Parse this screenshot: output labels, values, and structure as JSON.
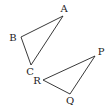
{
  "diagram": {
    "type": "geometry",
    "colors": {
      "stroke": "#222222",
      "background": "#ffffff"
    },
    "triangles": [
      {
        "name": "ABC",
        "vertices": [
          {
            "label": "A",
            "x": 63,
            "y": 16,
            "lx": 64,
            "ly": 9
          },
          {
            "label": "B",
            "x": 21,
            "y": 37,
            "lx": 13,
            "ly": 38
          },
          {
            "label": "C",
            "x": 31,
            "y": 65,
            "lx": 30,
            "ly": 72
          }
        ]
      },
      {
        "name": "PQR",
        "vertices": [
          {
            "label": "P",
            "x": 95,
            "y": 56,
            "lx": 101,
            "ly": 52
          },
          {
            "label": "Q",
            "x": 70,
            "y": 94,
            "lx": 70,
            "ly": 101
          },
          {
            "label": "R",
            "x": 43,
            "y": 80,
            "lx": 37,
            "ly": 81
          }
        ]
      }
    ]
  }
}
